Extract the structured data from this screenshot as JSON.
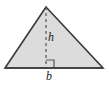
{
  "figure": {
    "type": "geometry-diagram",
    "background_color": "#ffffff",
    "shape": {
      "name": "triangle",
      "fill_color": "#dcdcdc",
      "stroke_color": "#3a3a3a",
      "stroke_width": 1.6,
      "vertices": [
        {
          "name": "apex",
          "x": 46,
          "y": 7
        },
        {
          "name": "bottom-left",
          "x": 5,
          "y": 68
        },
        {
          "name": "bottom-right",
          "x": 103,
          "y": 68
        }
      ],
      "points_path": "46,7 5,68 103,68"
    },
    "altitude": {
      "name": "height-line",
      "style": "dashed",
      "stroke_color": "#555555",
      "stroke_width": 1.2,
      "dash_pattern": "3,3",
      "x1": 46,
      "y1": 7,
      "x2": 46,
      "y2": 68
    },
    "right_angle_marker": {
      "name": "right-angle-marker",
      "stroke_color": "#555555",
      "stroke_width": 1.2,
      "size": 8,
      "path": "M 46 60 L 54 60 L 54 68"
    },
    "base_line": {
      "name": "base-segment",
      "stroke_color": "#3a3a3a",
      "stroke_width": 1.6,
      "x1": 5,
      "y1": 68,
      "x2": 103,
      "y2": 68
    },
    "labels": {
      "height": "h",
      "base": "b"
    }
  }
}
